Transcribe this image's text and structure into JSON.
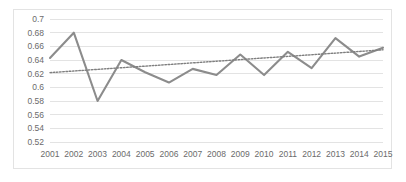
{
  "chart_data": {
    "type": "line",
    "title": "",
    "subtitle": "",
    "xlabel": "",
    "ylabel": "",
    "categories": [
      "2001",
      "2002",
      "2003",
      "2004",
      "2005",
      "2006",
      "2007",
      "2008",
      "2009",
      "2010",
      "2011",
      "2012",
      "2013",
      "2014",
      "2015"
    ],
    "series": [
      {
        "name": "Series 1",
        "type": "line",
        "color": "#8c8c8c",
        "style": "solid",
        "values": [
          0.643,
          0.68,
          0.58,
          0.64,
          0.622,
          0.607,
          0.627,
          0.618,
          0.648,
          0.618,
          0.652,
          0.628,
          0.672,
          0.645,
          0.658
        ]
      },
      {
        "name": "Trendline",
        "type": "line",
        "color": "#7f7f7f",
        "style": "dotted",
        "values": [
          0.6215,
          0.6239,
          0.6263,
          0.6287,
          0.631,
          0.6334,
          0.6358,
          0.6382,
          0.6406,
          0.643,
          0.6453,
          0.6477,
          0.6501,
          0.6525,
          0.6549
        ]
      }
    ],
    "ylim": [
      0.52,
      0.7
    ],
    "ytick_step": 0.02,
    "yticks": [
      "0.7",
      "0.68",
      "0.66",
      "0.64",
      "0.62",
      "0.6",
      "0.58",
      "0.56",
      "0.54",
      "0.52"
    ],
    "ytick_values": [
      0.7,
      0.68,
      0.66,
      0.64,
      0.62,
      0.6,
      0.58,
      0.56,
      0.54,
      0.52
    ],
    "grid": true,
    "grid_color": "#e3e3e3",
    "legend": false,
    "legend_position": "none",
    "plot_background": "#ffffff",
    "border_color": "#e3e3e3",
    "tick_label_color": "#6b6b6b"
  }
}
